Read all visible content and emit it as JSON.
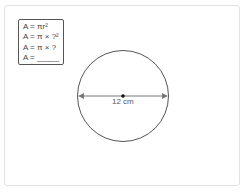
{
  "formulas": {
    "line1": "A = πr²",
    "line2": "A = π × ?²",
    "line3": "A = π × ?",
    "line4": "A = _____"
  },
  "circle": {
    "diameter_label": "12 cm",
    "stroke_color": "#555555",
    "arrow_color": "#777777"
  }
}
